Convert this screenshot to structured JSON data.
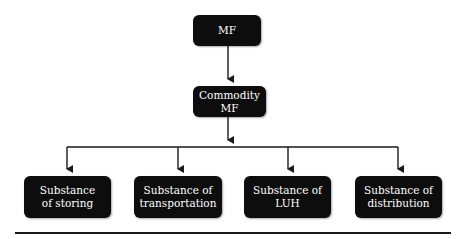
{
  "diagram": {
    "root": {
      "label": "MF"
    },
    "middle": {
      "label_line1": "Commodity",
      "label_line2": "MF"
    },
    "children": [
      {
        "line1": "Substance",
        "line2": "of storing"
      },
      {
        "line1": "Substance of",
        "line2": "transportation"
      },
      {
        "line1": "Substance of",
        "line2": "LUH"
      },
      {
        "line1": "Substance of",
        "line2": "distribution"
      }
    ],
    "colors": {
      "node_fill": "#0d0d0d",
      "node_text": "#ffffff",
      "line": "#1a1a1a"
    }
  }
}
